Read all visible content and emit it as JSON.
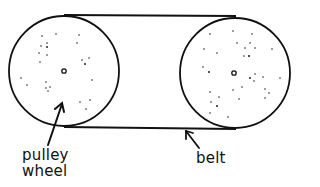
{
  "diagram": {
    "type": "belt-and-pulley",
    "labels": {
      "pulley_line1": "pulley",
      "pulley_line2": "wheel",
      "belt": "belt"
    },
    "colors": {
      "stroke": "#111111",
      "background": "#ffffff"
    },
    "components": [
      {
        "name": "left pulley wheel",
        "shape": "circle"
      },
      {
        "name": "right pulley wheel",
        "shape": "circle"
      },
      {
        "name": "belt",
        "shape": "loop around both wheels"
      }
    ]
  }
}
